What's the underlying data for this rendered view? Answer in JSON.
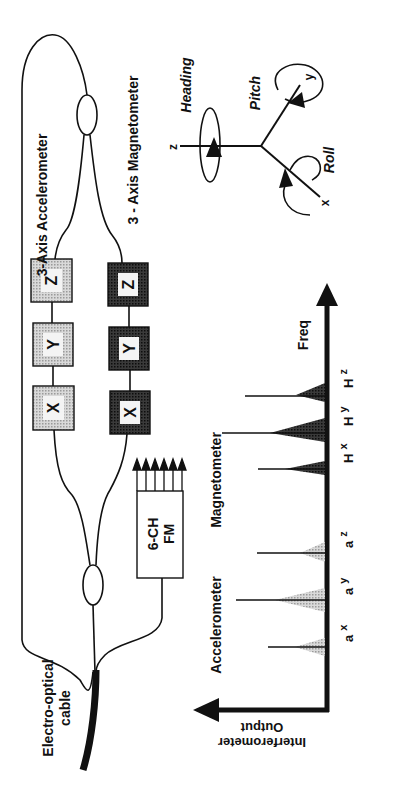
{
  "diagram": {
    "orientation": "rotated 90deg counter-clockwise",
    "colors": {
      "ink": "#111111",
      "accelerometer_fill": "#c8c8c8",
      "magnetometer_fill": "#2a2a2a",
      "peak_light": "#bdbdbd",
      "peak_dark": "#2b2b2b",
      "background": "#ffffff"
    },
    "sensor_array": {
      "accelerometer_label": "3-Axis  Accelerometer",
      "magnetometer_label": "3 - Axis  Magnetometer",
      "accelerometer_boxes": [
        "Z",
        "Y",
        "X"
      ],
      "magnetometer_boxes": [
        "Z",
        "Y",
        "X"
      ],
      "fm_box": {
        "line1": "6-CH",
        "line2": "FM",
        "channels": 6
      },
      "cable_label_line1": "Electro-optical",
      "cable_label_line2": "cable"
    },
    "axes_3d": {
      "z": "z",
      "y": "y",
      "x": "x",
      "heading": "Heading",
      "pitch": "Pitch",
      "roll": "Roll"
    },
    "spectrum": {
      "x_axis_label": "Freq",
      "y_axis_label_line1": "Interferometer",
      "y_axis_label_line2": "Output",
      "group_accelerometer": "Accelerometer",
      "group_magnetometer": "Magnetometer",
      "peaks": [
        {
          "name": "ax",
          "base": "a",
          "sub": "x",
          "group": "accelerometer"
        },
        {
          "name": "ay",
          "base": "a",
          "sub": "y",
          "group": "accelerometer"
        },
        {
          "name": "az",
          "base": "a",
          "sub": "z",
          "group": "accelerometer"
        },
        {
          "name": "Hx",
          "base": "H",
          "sub": "x",
          "group": "magnetometer"
        },
        {
          "name": "Hy",
          "base": "H",
          "sub": "y",
          "group": "magnetometer"
        },
        {
          "name": "Hz",
          "base": "H",
          "sub": "z",
          "group": "magnetometer"
        }
      ]
    }
  }
}
